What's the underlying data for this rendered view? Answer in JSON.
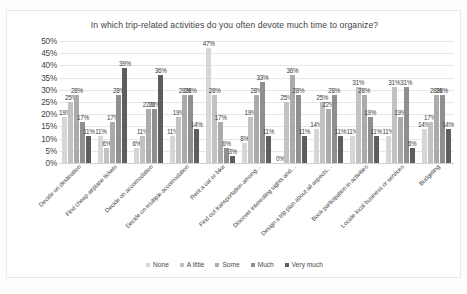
{
  "chart_data": {
    "type": "bar",
    "title": "In which trip-related activities do you often devote much time to organize?",
    "xlabel": "",
    "ylabel": "",
    "ylim": [
      0,
      50
    ],
    "ytick_labels": [
      "50%",
      "45%",
      "40%",
      "35%",
      "30%",
      "25%",
      "20%",
      "15%",
      "10%",
      "5%",
      "0%"
    ],
    "ytick_values": [
      50,
      45,
      40,
      35,
      30,
      25,
      20,
      15,
      10,
      5,
      0
    ],
    "grid": true,
    "legend_position": "bottom",
    "value_suffix": "%",
    "categories": [
      "Decide on destination",
      "Find cheap airplane tickets",
      "Decide on accomodation",
      "Decide on multiple accomodation",
      "Rent a car or bike",
      "Find out transportation among…",
      "Discover interesting sights and…",
      "Design a trip plan about all aspects…",
      "Book participation in activities",
      "Locate local business or services",
      "Budgeting"
    ],
    "series": [
      {
        "name": "None",
        "color": "#d6d6d6",
        "values": [
          19,
          11,
          6,
          11,
          47,
          8,
          0,
          14,
          11,
          11,
          14
        ]
      },
      {
        "name": "A little",
        "color": "#c2c2c2",
        "values": [
          25,
          6,
          11,
          19,
          28,
          19,
          25,
          25,
          31,
          31,
          17
        ]
      },
      {
        "name": "Some",
        "color": "#ababab",
        "values": [
          28,
          17,
          22,
          28,
          17,
          28,
          36,
          22,
          28,
          19,
          28
        ]
      },
      {
        "name": "Much",
        "color": "#8f8f8f",
        "values": [
          17,
          28,
          22,
          28,
          6,
          33,
          28,
          28,
          19,
          31,
          28
        ]
      },
      {
        "name": "Very much",
        "color": "#5e5e5e",
        "values": [
          11,
          39,
          36,
          14,
          3,
          11,
          11,
          11,
          11,
          6,
          14
        ]
      }
    ]
  }
}
